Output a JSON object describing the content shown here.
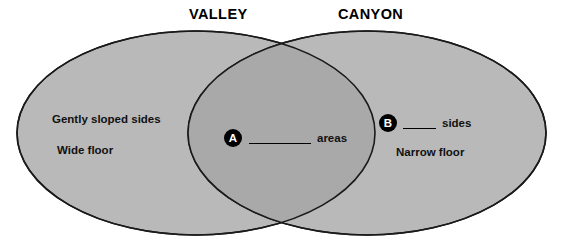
{
  "diagram": {
    "type": "venn-two-set",
    "left_set": {
      "title": "VALLEY",
      "items": [
        "Gently sloped sides",
        "Wide floor"
      ]
    },
    "right_set": {
      "title": "CANYON",
      "items": [
        "Narrow floor"
      ]
    },
    "blanks": [
      {
        "marker": "A",
        "region": "intersection",
        "trailing_text": "areas"
      },
      {
        "marker": "B",
        "region": "right-only",
        "trailing_text": "sides"
      }
    ],
    "colors": {
      "background": "#ffffff",
      "ellipse_fill": "#b9b9b9",
      "intersection_fill": "#a9a9a9",
      "outline": "#1a1a1a",
      "text": "#111111",
      "marker_badge_fill": "#000000",
      "marker_badge_text": "#ffffff"
    }
  }
}
